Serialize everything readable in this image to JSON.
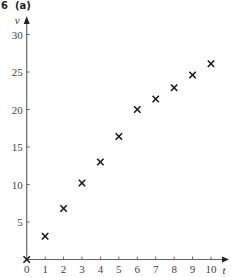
{
  "heading": {
    "number": "6",
    "part": "(a)"
  },
  "chart_data": {
    "type": "scatter",
    "title": "",
    "xlabel": "t",
    "ylabel": "v",
    "x": [
      0,
      1,
      2,
      3,
      4,
      5,
      6,
      7,
      8,
      9,
      10
    ],
    "y": [
      0,
      3.1,
      6.8,
      10.2,
      13.0,
      16.4,
      20.0,
      21.4,
      22.9,
      24.6,
      26.1
    ],
    "xlim": [
      0,
      10
    ],
    "ylim": [
      0,
      30
    ],
    "xticks": [
      0,
      1,
      2,
      3,
      4,
      5,
      6,
      7,
      8,
      9,
      10
    ],
    "yticks": [
      5,
      10,
      15,
      20,
      25,
      30
    ],
    "marker": "x",
    "grid": false,
    "legend": null
  }
}
